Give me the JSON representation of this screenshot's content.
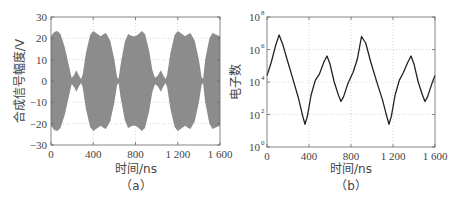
{
  "chart_data": [
    {
      "id": "a",
      "type": "area",
      "caption": "（a）",
      "title": "",
      "xlabel": "时间/ns",
      "ylabel": "合成信号幅度/V",
      "xlim": [
        0,
        1600
      ],
      "ylim": [
        -30,
        30
      ],
      "xticks": [
        0,
        400,
        800,
        1200,
        1600
      ],
      "xtick_labels": [
        "0",
        "400",
        "800",
        "1 200",
        "1 600"
      ],
      "yticks": [
        30,
        20,
        10,
        0,
        -10,
        -20,
        -30
      ],
      "ytick_labels": [
        "30",
        "20",
        "10",
        "0",
        "-10",
        "-20",
        "-30"
      ],
      "grid": "dotted",
      "fill_color": "#8c8c8c",
      "description": "Symmetric envelope (±) of a high-frequency composite signal",
      "envelope": {
        "t": [
          0,
          30,
          60,
          90,
          130,
          170,
          195,
          215,
          240,
          265,
          285,
          300,
          330,
          370,
          400,
          440,
          470,
          500,
          520,
          560,
          600,
          625,
          640,
          660,
          700,
          730,
          770,
          800,
          830,
          860,
          890,
          930,
          960,
          985,
          1010,
          1040,
          1065,
          1085,
          1100,
          1130,
          1170,
          1200,
          1240,
          1270,
          1300,
          1320,
          1360,
          1400,
          1425,
          1440,
          1460,
          1500,
          1530,
          1570,
          1600
        ],
        "amplitude": [
          21,
          23,
          23.5,
          22,
          16,
          7,
          1.5,
          2.5,
          5,
          2.5,
          1,
          3,
          13,
          21.5,
          23.5,
          22,
          21,
          22,
          22.5,
          19,
          10,
          2,
          1,
          8,
          18.5,
          22,
          21,
          21,
          22,
          23.5,
          22,
          14,
          5,
          1.5,
          2.5,
          5,
          2.5,
          1,
          3,
          13,
          21.5,
          23.5,
          22,
          21,
          22,
          22.5,
          19,
          10,
          2,
          1,
          10,
          20,
          22.5,
          21.5,
          21
        ]
      }
    },
    {
      "id": "b",
      "type": "line",
      "caption": "（b）",
      "title": "",
      "xlabel": "时间/ns",
      "ylabel": "电子数",
      "yscale": "log",
      "xlim": [
        0,
        1600
      ],
      "ylim": [
        1,
        100000000
      ],
      "xticks": [
        0,
        400,
        800,
        1200,
        1600
      ],
      "xtick_labels": [
        "0",
        "400",
        "800",
        "1 200",
        "1 600"
      ],
      "yticks": [
        1,
        100,
        10000,
        1000000,
        100000000
      ],
      "ytick_labels": [
        {
          "base": "10",
          "exp": "0"
        },
        {
          "base": "10",
          "exp": "2"
        },
        {
          "base": "10",
          "exp": "4"
        },
        {
          "base": "10",
          "exp": "6"
        },
        {
          "base": "10",
          "exp": "8"
        }
      ],
      "grid": "dotted",
      "line_color": "#222222",
      "series": [
        {
          "name": "电子数",
          "t": [
            0,
            40,
            80,
            115,
            150,
            200,
            250,
            300,
            340,
            362,
            385,
            420,
            460,
            500,
            540,
            571,
            600,
            640,
            680,
            705,
            730,
            770,
            820,
            860,
            900,
            940,
            990,
            1050,
            1100,
            1140,
            1162,
            1185,
            1220,
            1260,
            1300,
            1340,
            1371,
            1400,
            1440,
            1480,
            1505,
            1530,
            1570,
            1600
          ],
          "log10": [
            4.4,
            5.2,
            6.2,
            6.9,
            6.3,
            5.2,
            4.1,
            3.0,
            1.9,
            1.4,
            1.9,
            3.2,
            4.1,
            4.5,
            5.2,
            5.6,
            5.1,
            4.0,
            3.2,
            2.8,
            3.1,
            3.9,
            4.6,
            5.4,
            6.8,
            6.4,
            5.2,
            3.9,
            2.9,
            1.9,
            1.4,
            1.9,
            3.2,
            4.1,
            4.6,
            5.2,
            5.6,
            5.1,
            4.0,
            3.2,
            2.8,
            3.1,
            3.9,
            4.4
          ]
        }
      ]
    }
  ]
}
